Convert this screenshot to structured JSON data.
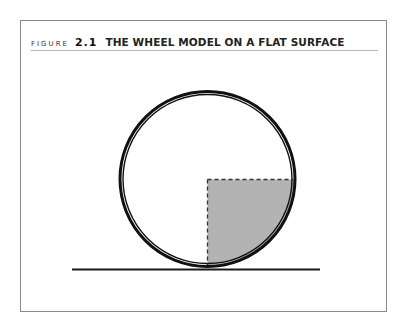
{
  "figure": {
    "label": "FIGURE",
    "number": "2.1",
    "title": "THE WHEEL MODEL ON A FLAT SURFACE"
  },
  "diagram": {
    "elements": [
      "wheel (double ring circle)",
      "shaded quarter sector (lower-right) with dashed radii",
      "flat ground line"
    ],
    "colors": {
      "frame_border": "#8a8a8a",
      "separator": "#b5b5b5",
      "ring": "#111111",
      "shaded_quarter": "#b3b3b3",
      "ground": "#1a1a1a"
    }
  }
}
